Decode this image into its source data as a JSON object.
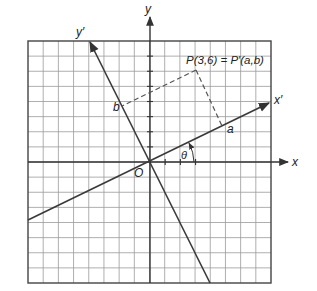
{
  "diagram": {
    "grid": {
      "cells_x": 16,
      "cells_y": 16,
      "origin_cell": [
        8,
        8
      ]
    },
    "axes": {
      "x_label": "x",
      "y_label": "y",
      "x_prime_label": "x′",
      "y_prime_label": "y′",
      "origin_label": "O"
    },
    "point_label": "P(3,6) = P′(a,b)",
    "point": {
      "x": 3,
      "y": 6
    },
    "projection_labels": {
      "a": "a",
      "b": "b"
    },
    "angle_label": "θ",
    "colors": {
      "grid": "#9a9a9a",
      "axis": "#333333",
      "border": "#444444",
      "line": "#3a3a3a",
      "dashed": "#555555"
    }
  }
}
